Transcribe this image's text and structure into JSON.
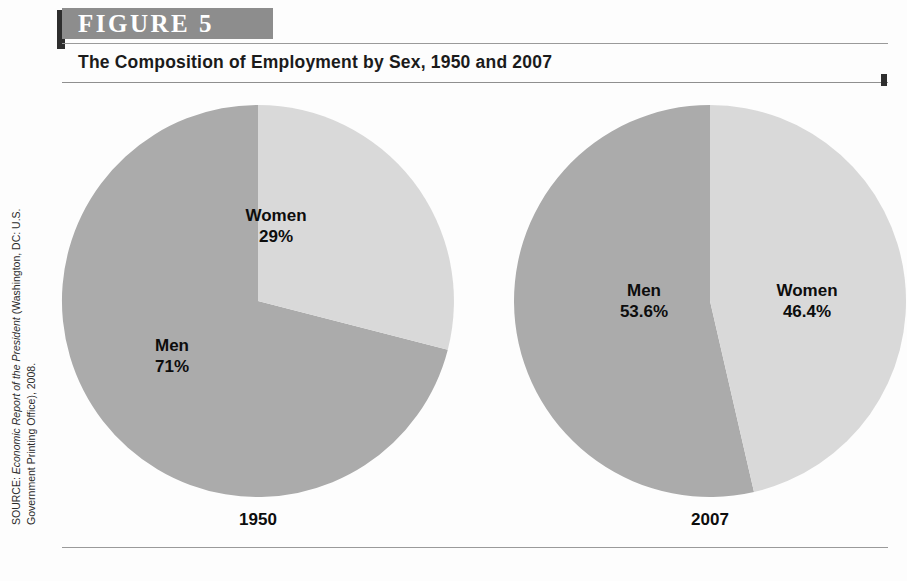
{
  "header": {
    "figure_label": "FIGURE  5",
    "title": "The Composition of Employment by Sex, 1950 and 2007"
  },
  "source": {
    "line1_prefix": "SOURCE: ",
    "line1_italic": "Economic Report of the President",
    "line1_suffix": " (Washington, DC: U.S.",
    "line2": "Government Printing Office), 2008."
  },
  "colors": {
    "men_slice": "#ababab",
    "women_slice": "#d9d9d9",
    "header_bar": "#8d8d8d",
    "header_tab": "#2e2e2e",
    "rule": "#9a9a9a",
    "text": "#0d0d0d"
  },
  "charts": [
    {
      "year_label": "1950",
      "men_name": "Men",
      "men_value_label": "71%",
      "women_name": "Women",
      "women_value_label": "29%"
    },
    {
      "year_label": "2007",
      "men_name": "Men",
      "men_value_label": "53.6%",
      "women_name": "Women",
      "women_value_label": "46.4%"
    }
  ],
  "chart_data": [
    {
      "type": "pie",
      "title": "1950",
      "labels": [
        "Women",
        "Men"
      ],
      "values": [
        29,
        71
      ],
      "value_labels": [
        "29%",
        "71%"
      ],
      "colors": [
        "#d9d9d9",
        "#ababab"
      ],
      "start_angle_deg": 0,
      "direction": "clockwise",
      "units": "percent",
      "legend": "none"
    },
    {
      "type": "pie",
      "title": "2007",
      "labels": [
        "Women",
        "Men"
      ],
      "values": [
        46.4,
        53.6
      ],
      "value_labels": [
        "46.4%",
        "53.6%"
      ],
      "colors": [
        "#d9d9d9",
        "#ababab"
      ],
      "start_angle_deg": 0,
      "direction": "clockwise",
      "units": "percent",
      "legend": "none"
    }
  ]
}
